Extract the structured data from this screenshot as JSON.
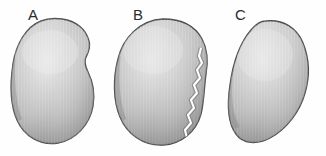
{
  "figure": {
    "background_color": "#fefefe",
    "width": 326,
    "height": 156
  },
  "panels": [
    {
      "id": "a",
      "label": "A",
      "caption": "Intact specimen, broad pear-shaped outline with a shallow notch on the upper right margin",
      "has_fracture": false,
      "fill_color": "#c9c9c9",
      "outline_color": "#4a4a4a",
      "highlight_color": "#e6e6e6",
      "shadow_color": "#8f8f8f"
    },
    {
      "id": "b",
      "label": "B",
      "caption": "Fractured specimen, jagged crack separating a narrow right-hand fragment",
      "has_fracture": true,
      "fracture_label": "crack",
      "fill_color": "#c6c6c6",
      "outline_color": "#474747",
      "highlight_color": "#e4e4e4",
      "shadow_color": "#8c8c8c"
    },
    {
      "id": "c",
      "label": "C",
      "caption": "Intact specimen, obliquely tilted oval outline with bulge on the upper right",
      "has_fracture": false,
      "fill_color": "#c7c7c7",
      "outline_color": "#484848",
      "highlight_color": "#e5e5e5",
      "shadow_color": "#8d8d8d"
    }
  ],
  "palette": {
    "background": "#fefefe",
    "label_text": "#2b2b2b",
    "specimen_mid": "#c8c8c8",
    "specimen_light": "#e6e6e6",
    "specimen_dark": "#8b8b8b",
    "outline": "#484848",
    "fracture_line": "#ffffff"
  }
}
